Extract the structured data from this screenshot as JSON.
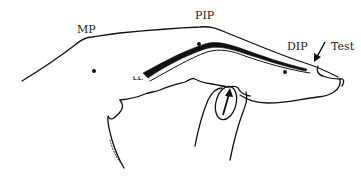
{
  "diagram": {
    "type": "anatomical line drawing - finger lateral view",
    "labels": {
      "mp": "MP",
      "pip": "PIP",
      "dip": "DIP",
      "test": "Test",
      "ll": "L.L."
    },
    "joints": [
      {
        "name": "MP",
        "dot": [
          94,
          71
        ]
      },
      {
        "name": "PIP",
        "dot": [
          199,
          44
        ]
      },
      {
        "name": "DIP",
        "dot": [
          285,
          72
        ]
      }
    ],
    "colors": {
      "line": "#111111",
      "ligament_fill": "#111111",
      "background": "#ffffff",
      "text": "#222222"
    }
  }
}
